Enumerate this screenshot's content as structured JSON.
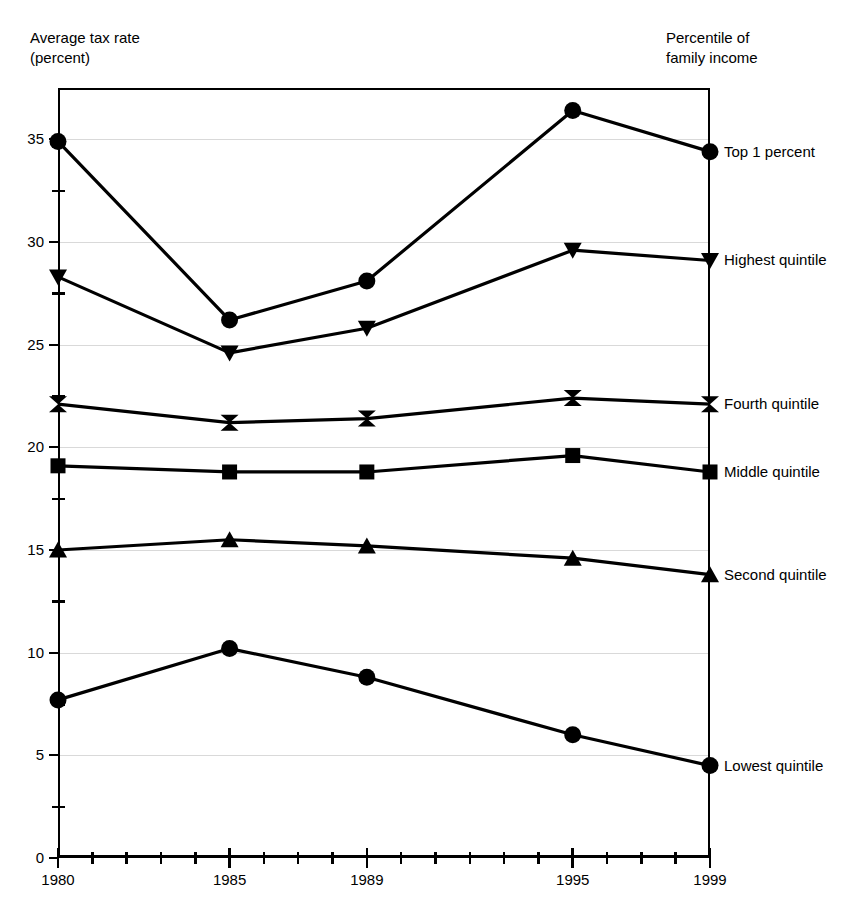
{
  "axis_captions": {
    "y_line1": "Average tax rate",
    "y_line2": "(percent)",
    "r_line1": "Percentile of",
    "r_line2": "family income"
  },
  "chart_data": {
    "type": "line",
    "title": "",
    "xlabel": "",
    "ylabel": "Average tax rate (percent)",
    "x": [
      1980,
      1985,
      1989,
      1995,
      1999
    ],
    "x_tick_labels": [
      "1980",
      "1985",
      "1989",
      "1995",
      "1999"
    ],
    "x_minor_ticks": [
      1981,
      1982,
      1983,
      1984,
      1986,
      1987,
      1988,
      1990,
      1991,
      1992,
      1993,
      1994,
      1996,
      1997,
      1998
    ],
    "xlim": [
      1980,
      1999
    ],
    "y_tick_labels": [
      "0",
      "5",
      "10",
      "15",
      "20",
      "25",
      "30",
      "35"
    ],
    "y_major_ticks": [
      0,
      5,
      10,
      15,
      20,
      25,
      30,
      35
    ],
    "y_minor_ticks": [
      2.5,
      7.5,
      12.5,
      17.5,
      22.5,
      27.5,
      32.5
    ],
    "ylim": [
      0,
      37.5
    ],
    "grid": "horizontal-major",
    "legend_position": "right-of-axis-endpoints",
    "series": [
      {
        "name": "Top 1 percent",
        "marker": "circle",
        "values": [
          34.9,
          26.2,
          28.1,
          36.4,
          34.4
        ]
      },
      {
        "name": "Highest quintile",
        "marker": "triangle-down",
        "values": [
          28.3,
          24.6,
          25.8,
          29.6,
          29.1
        ]
      },
      {
        "name": "Fourth quintile",
        "marker": "bowtie",
        "values": [
          22.1,
          21.2,
          21.4,
          22.4,
          22.1
        ]
      },
      {
        "name": "Middle quintile",
        "marker": "square",
        "values": [
          19.1,
          18.8,
          18.8,
          19.6,
          18.8
        ]
      },
      {
        "name": "Second quintile",
        "marker": "triangle-up",
        "values": [
          15.0,
          15.5,
          15.2,
          14.6,
          13.8
        ]
      },
      {
        "name": "Lowest quintile",
        "marker": "circle",
        "values": [
          7.7,
          10.2,
          8.8,
          6.0,
          4.5
        ]
      }
    ]
  },
  "colors": {
    "line": "#000000",
    "grid": "#d9d9d9",
    "axis": "#000000",
    "background": "#ffffff"
  }
}
